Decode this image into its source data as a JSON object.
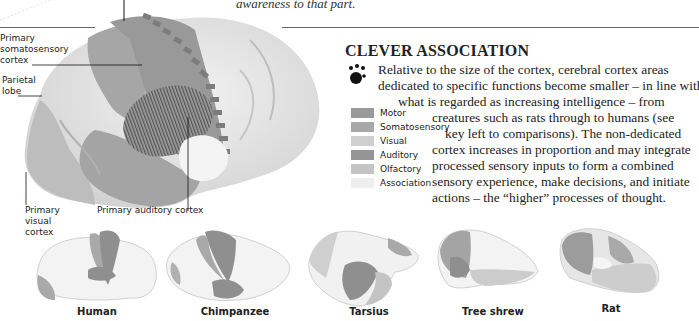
{
  "top_caption": {
    "text": "awareness to that part."
  },
  "main_brain": {
    "labels": {
      "somatosensory": [
        "Primary",
        "somatosensory",
        "cortex"
      ],
      "parietal": [
        "Parietal",
        "lobe"
      ],
      "visual": [
        "Primary",
        "visual",
        "cortex"
      ],
      "auditory": "Primary auditory cortex"
    }
  },
  "section": {
    "heading": "CLEVER ASSOCIATION",
    "icon": "paw-dots-icon",
    "paragraph_lines": [
      "Relative to the size of the cortex, cerebral cortex areas",
      "dedicated to specific functions become smaller – in line with",
      "what is regarded as increasing intelligence – from",
      "creatures such as rats through to humans (see",
      "key left to comparisons). The non-dedicated",
      "cortex increases in proportion and may integrate",
      "processed sensory inputs to form a combined",
      "sensory experience, make decisions, and initiate",
      "actions – the “higher” processes of thought."
    ]
  },
  "legend": {
    "items": [
      {
        "label": "Motor",
        "color": "#9a9a9a"
      },
      {
        "label": "Somatosensory",
        "color": "#a8a8a8"
      },
      {
        "label": "Visual",
        "color": "#cfcfcf"
      },
      {
        "label": "Auditory",
        "color": "#959595"
      },
      {
        "label": "Olfactory",
        "color": "#c4c4c4"
      },
      {
        "label": "Association",
        "color": "#efefef"
      }
    ]
  },
  "comparisons": [
    {
      "name": "Human"
    },
    {
      "name": "Chimpanzee"
    },
    {
      "name": "Tarsius"
    },
    {
      "name": "Tree shrew"
    },
    {
      "name": "Rat"
    }
  ]
}
